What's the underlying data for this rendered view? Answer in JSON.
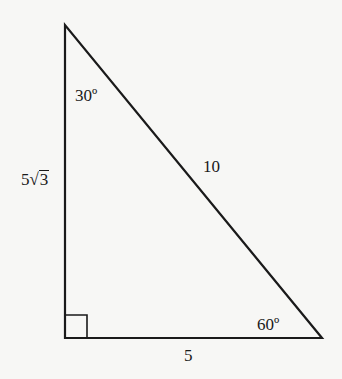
{
  "diagram": {
    "type": "right-triangle",
    "vertices": {
      "top": {
        "x": 65,
        "y": 25
      },
      "right_angle": {
        "x": 65,
        "y": 338
      },
      "bottom_right": {
        "x": 322,
        "y": 338
      }
    },
    "stroke_color": "#1a1a1a",
    "background": "#f7f7f5",
    "labels": {
      "top_angle": "30º",
      "bottom_right_angle": "60º",
      "hypotenuse": "10",
      "base": "5",
      "vertical_side_coefficient": "5",
      "vertical_side_radical_symbol": "√",
      "vertical_side_radicand": "3"
    },
    "right_angle_marker": true
  }
}
